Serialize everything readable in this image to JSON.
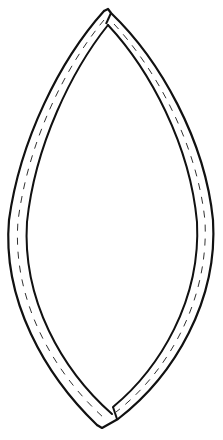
{
  "illustration": {
    "subject": "Pointed oval (vesica / leaf-shaped) frame made of two curved strips with dashed stitching lines",
    "background": "#ffffff",
    "stroke_color": "#111111",
    "stitch_color": "#333333",
    "parts": [
      {
        "name": "left-strip",
        "description": "Curved strip forming left side, from top tip to bottom tip"
      },
      {
        "name": "right-strip",
        "description": "Curved strip forming right side, butting against left strip at top and bottom"
      },
      {
        "name": "stitching",
        "description": "Dashed line running along the center of each strip"
      }
    ]
  }
}
